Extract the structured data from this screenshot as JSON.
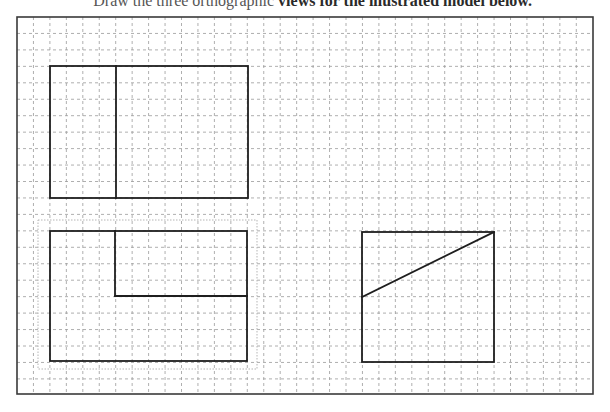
{
  "caption": {
    "prefix": "Draw the three orthographic",
    "text": "views for the illustrated model below."
  },
  "sheet": {
    "frame": {
      "x": 17,
      "y": 17,
      "width": 576,
      "height": 377,
      "stroke": "#3a3a3a"
    },
    "grid": {
      "origin_x": 17,
      "origin_y": 17,
      "cell": 16.45,
      "columns": 35,
      "rows": 23,
      "line_color": "#9a9a9a",
      "dash": "3,3"
    }
  },
  "views": [
    {
      "name": "top-left-view",
      "outline": {
        "x1": 50,
        "y1": 66,
        "x2": 248,
        "y2": 198
      },
      "lines": [
        {
          "x1": 116,
          "y1": 66,
          "x2": 116,
          "y2": 198
        }
      ]
    },
    {
      "name": "bottom-left-view",
      "outline": {
        "x1": 50,
        "y1": 231,
        "x2": 247,
        "y2": 361
      },
      "lines": [
        {
          "x1": 115,
          "y1": 231,
          "x2": 115,
          "y2": 296
        },
        {
          "x1": 115,
          "y1": 296,
          "x2": 247,
          "y2": 296
        }
      ],
      "highlight_box": {
        "x1": 38,
        "y1": 220,
        "x2": 257,
        "y2": 369
      }
    },
    {
      "name": "right-view",
      "outline": {
        "x1": 362,
        "y1": 232,
        "x2": 494,
        "y2": 362
      },
      "lines": [
        {
          "x1": 362,
          "y1": 297,
          "x2": 494,
          "y2": 232
        }
      ]
    }
  ],
  "colors": {
    "stroke": "#1e1e1e",
    "grid": "#9a9a9a",
    "highlight": "#b5b5b5",
    "background": "#ffffff"
  }
}
